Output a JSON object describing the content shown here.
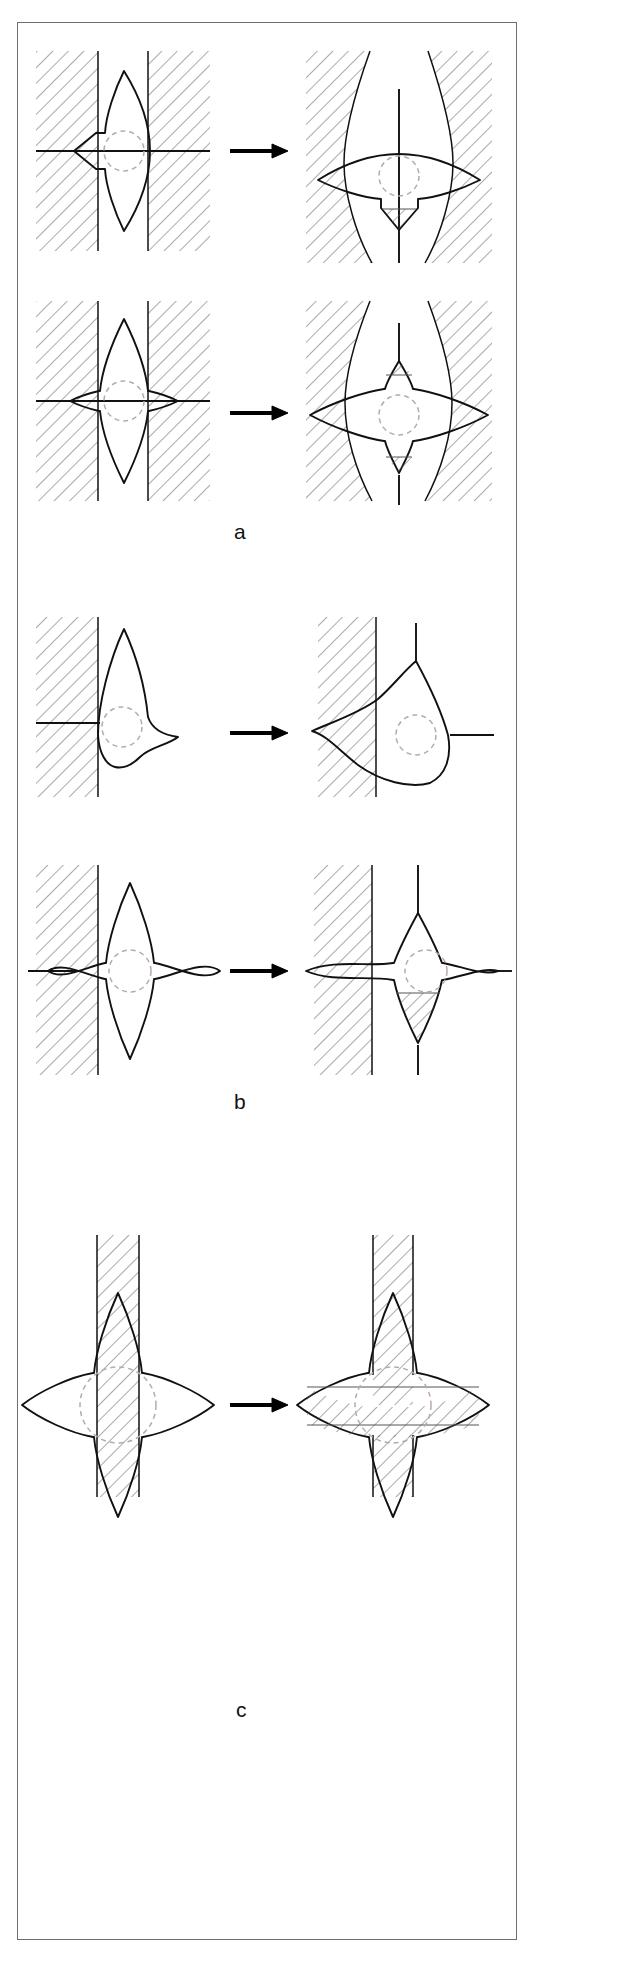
{
  "figure": {
    "type": "scientific-line-diagram",
    "width": 634,
    "height": 1965,
    "background_color": "#ffffff",
    "border_color": "#6e6e6e",
    "sections": [
      {
        "id": "a",
        "label": "a",
        "label_x": 236,
        "label_y": 522,
        "rows": [
          {
            "id": "a1",
            "left": {
              "shape": "lens-two-point-vertical",
              "walls": "two-vertical-straight-walls",
              "axis": "horizontal-line",
              "dashed_circle": true
            },
            "right": {
              "shape": "lens-two-point-horizontal",
              "walls": "two-curved-walls",
              "axis": "vertical-line",
              "dashed_circle": true,
              "hatched_notch": true
            },
            "arrow": "right-arrow"
          },
          {
            "id": "a2",
            "left": {
              "shape": "four-point-star-vertical",
              "walls": "two-vertical-straight-walls",
              "axis": "horizontal-line",
              "dashed_circle": true
            },
            "right": {
              "shape": "four-point-star-horizontal",
              "walls": "two-curved-walls",
              "axis": "vertical-line",
              "dashed_circle": true,
              "hatched_notch": true
            },
            "arrow": "right-arrow"
          }
        ]
      },
      {
        "id": "b",
        "label": "b",
        "label_x": 236,
        "label_y": 1094,
        "rows": [
          {
            "id": "b1",
            "left": {
              "shape": "asymmetric-teardrop",
              "walls": "single-left-wall",
              "axis": "horizontal-line-left",
              "dashed_circle": true
            },
            "right": {
              "shape": "asymmetric-teardrop-rotated",
              "walls": "single-left-wall",
              "axis": "vertical-and-horizontal-lines",
              "dashed_circle": true
            },
            "arrow": "right-arrow"
          },
          {
            "id": "b2",
            "left": {
              "shape": "four-point-star",
              "walls": "single-left-wall",
              "axis": "horizontal-line-left",
              "dashed_circle": true
            },
            "right": {
              "shape": "four-point-star-shifted",
              "walls": "single-left-wall",
              "axis": "vertical-and-horizontal-lines",
              "dashed_circle": true,
              "hatched_notch": true
            },
            "arrow": "right-arrow"
          }
        ]
      },
      {
        "id": "c",
        "label": "c",
        "label_x": 238,
        "label_y": 1700,
        "rows": [
          {
            "id": "c1",
            "left": {
              "shape": "four-point-star",
              "walls": "vertical-hatched-band",
              "dashed_circle": true
            },
            "right": {
              "shape": "four-point-star",
              "walls": "vertical-hatched-band-plus-horizontal-hatched-band",
              "dashed_circle": true
            },
            "arrow": "right-arrow"
          }
        ]
      }
    ],
    "colors": {
      "outline": "#111111",
      "hatch": "#555555",
      "dashed_circle": "#b9a9a9",
      "arrow": "#000000",
      "frame": "#6e6e6e"
    }
  }
}
